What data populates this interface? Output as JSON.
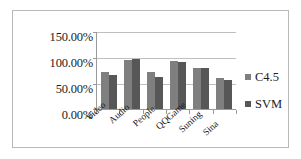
{
  "chart_data": {
    "type": "bar",
    "title": "",
    "xlabel": "",
    "ylabel": "",
    "categories": [
      "Video",
      "Audio",
      "People",
      "QQGame",
      "Suning",
      "Sina"
    ],
    "series": [
      {
        "name": "C4.5",
        "color": "#7f7f7f",
        "values": [
          72,
          96,
          73,
          94,
          80,
          60
        ]
      },
      {
        "name": "SVM",
        "color": "#575757",
        "values": [
          67,
          97,
          63,
          91,
          79,
          57
        ]
      }
    ],
    "ylim": [
      0,
      150
    ],
    "yticks": [
      0,
      50,
      100,
      150
    ],
    "ytick_labels": [
      "0.00%",
      "50.00%",
      "100.00%",
      "150.00%"
    ],
    "grid": true,
    "legend_position": "right",
    "value_unit": "%"
  },
  "legend": {
    "items": [
      {
        "label": "C4.5"
      },
      {
        "label": "SVM"
      }
    ]
  }
}
